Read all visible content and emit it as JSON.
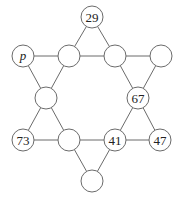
{
  "diagram": {
    "type": "hexagram-number-puzzle",
    "nodes": [
      {
        "id": "top",
        "x": 92,
        "y": 17,
        "label": ""
      },
      {
        "id": "upper-left",
        "x": 23,
        "y": 56,
        "label": ""
      },
      {
        "id": "upper-inner-left",
        "x": 69,
        "y": 56,
        "label": ""
      },
      {
        "id": "upper-inner-right",
        "x": 115,
        "y": 56,
        "label": ""
      },
      {
        "id": "upper-right",
        "x": 161,
        "y": 56,
        "label": ""
      },
      {
        "id": "mid-left",
        "x": 46,
        "y": 98,
        "label": ""
      },
      {
        "id": "mid-right",
        "x": 138,
        "y": 98,
        "label": ""
      },
      {
        "id": "lower-left",
        "x": 23,
        "y": 140,
        "label": ""
      },
      {
        "id": "lower-inner-left",
        "x": 69,
        "y": 140,
        "label": ""
      },
      {
        "id": "lower-inner-right",
        "x": 115,
        "y": 140,
        "label": ""
      },
      {
        "id": "lower-right",
        "x": 160,
        "y": 140,
        "label": ""
      },
      {
        "id": "bottom",
        "x": 92,
        "y": 181,
        "label": ""
      }
    ],
    "labels": {
      "top": "29",
      "upper_left": "p",
      "upper_inner_left": "",
      "upper_inner_right": "",
      "upper_right": "",
      "mid_left": "",
      "mid_right": "67",
      "lower_left": "73",
      "lower_inner_left": "",
      "lower_inner_right": "41",
      "lower_right": "47",
      "bottom": ""
    },
    "variable_node": "upper_left",
    "node_radius": 11,
    "colors": {
      "stroke": "#6b6b6b",
      "text": "#222222",
      "fill": "#ffffff"
    }
  }
}
